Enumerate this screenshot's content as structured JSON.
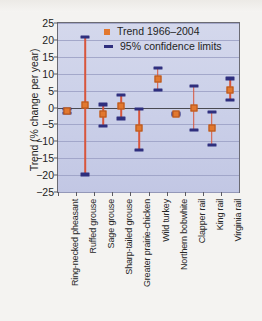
{
  "figure": {
    "background_color": "#f4f3f1",
    "plot_background_color": "#ccd1e9",
    "trend_color": "#e2782f",
    "ci_cap_color": "#2f2f7e",
    "ci_line_color": "#d8563c"
  },
  "legend": {
    "position": "top-center",
    "entries": [
      {
        "label": "Trend 1966–2004",
        "marker": "square-marker-icon"
      },
      {
        "label": "95% confidence limits",
        "marker": "dash-marker-icon"
      }
    ]
  },
  "chart_data": {
    "type": "scatter",
    "title": "",
    "xlabel": "",
    "ylabel": "Trend (% change per year)",
    "ylim": [
      -25,
      25
    ],
    "yticks": [
      25,
      20,
      15,
      10,
      5,
      0,
      -5,
      -10,
      -15,
      -20,
      -25
    ],
    "ytick_labels": [
      "25",
      "20",
      "15",
      "10",
      "5",
      "0",
      "−5",
      "−10",
      "−15",
      "−20",
      "−25"
    ],
    "grid": true,
    "zero_line": true,
    "legend_position": "top-center",
    "categories": [
      "Ring-necked pheasant",
      "Ruffed grouse",
      "Sage grouse",
      "Sharp-tailed grouse",
      "Greater prairie-chicken",
      "Wild turkey",
      "Northern bobwhite",
      "Clapper rail",
      "King rail",
      "Virginia rail"
    ],
    "series": [
      {
        "name": "Trend 1966–2004",
        "values": [
          -1.0,
          0.8,
          -2.0,
          0.3,
          -6.2,
          8.3,
          -1.9,
          0.0,
          -6.0,
          5.2
        ]
      },
      {
        "name": "95% confidence limits",
        "upper": [
          -0.4,
          21.0,
          0.9,
          3.7,
          -0.3,
          11.6,
          -1.6,
          6.3,
          -1.3,
          8.6
        ],
        "lower": [
          -1.6,
          -19.8,
          -5.4,
          -3.2,
          -12.5,
          5.3,
          -2.2,
          -6.7,
          -11.0,
          2.2
        ]
      }
    ]
  }
}
